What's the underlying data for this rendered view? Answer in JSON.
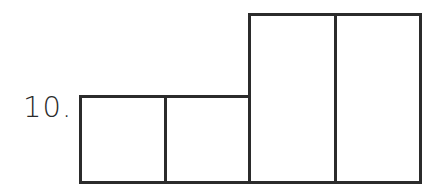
{
  "problem": {
    "number_label": "10."
  },
  "figure": {
    "stroke_color": "#2b2b2b",
    "fill_color": "#ffffff",
    "rectangles": [
      {
        "id": "short-1",
        "x": 79,
        "y": 95,
        "w": 88,
        "h": 89
      },
      {
        "id": "short-2",
        "x": 164,
        "y": 95,
        "w": 87,
        "h": 89
      },
      {
        "id": "tall-1",
        "x": 248,
        "y": 13,
        "w": 89,
        "h": 171
      },
      {
        "id": "tall-2",
        "x": 334,
        "y": 13,
        "w": 88,
        "h": 171
      }
    ]
  }
}
